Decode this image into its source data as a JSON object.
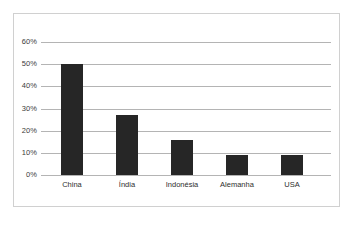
{
  "chart_data": {
    "type": "bar",
    "title": "",
    "subtitle": "",
    "xlabel": "",
    "ylabel": "",
    "categories": [
      "China",
      "Índia",
      "Indonésia",
      "Alemanha",
      "USA"
    ],
    "values": [
      50,
      27,
      16,
      9,
      9
    ],
    "value_suffix": "%",
    "ylim": [
      0,
      60
    ],
    "ytick_values": [
      0,
      10,
      20,
      30,
      40,
      50,
      60
    ],
    "ytick_labels": [
      "0%",
      "10%",
      "20%",
      "30%",
      "40%",
      "50%",
      "60%"
    ],
    "grid": true,
    "grid_axis": "y",
    "legend": false,
    "legend_position": "none",
    "series": [
      {
        "name": "",
        "values": [
          50,
          27,
          16,
          9,
          9
        ]
      }
    ]
  },
  "style": {
    "bar_color": "#262626",
    "grid_color": "#b4b4b4",
    "frame_color": "#d0d0d0",
    "background": "#ffffff",
    "tick_label_color": "#3b3b3b",
    "category_label_color": "#2e2e2e"
  }
}
